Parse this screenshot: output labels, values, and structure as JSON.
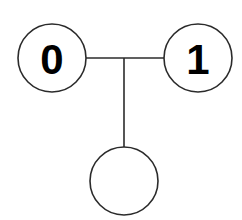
{
  "diagram": {
    "background_color": "#ffffff",
    "stroke_color": "#2b2b2b",
    "label_color": "#000000",
    "canvas": {
      "width": 242,
      "height": 220
    },
    "nodes": [
      {
        "id": "node-0",
        "label": "0",
        "cx": 52,
        "cy": 58,
        "r": 34,
        "has_label": true
      },
      {
        "id": "node-1",
        "label": "1",
        "cx": 198,
        "cy": 58,
        "r": 34,
        "has_label": true
      },
      {
        "id": "node-unlabeled",
        "label": "",
        "cx": 124,
        "cy": 181,
        "r": 34,
        "has_label": false
      }
    ],
    "edges": [
      {
        "id": "edge-horizontal",
        "from": "node-0",
        "to": "node-1",
        "x1": 86,
        "y1": 58,
        "x2": 165,
        "y2": 58
      },
      {
        "id": "edge-vertical",
        "from": "edge-horizontal",
        "to": "node-unlabeled",
        "x1": 124,
        "y1": 58,
        "x2": 124,
        "y2": 147
      }
    ]
  }
}
